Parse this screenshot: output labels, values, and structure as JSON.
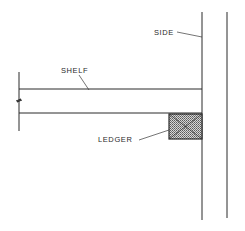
{
  "diagram": {
    "labels": {
      "side": "SIDE",
      "shelf": "SHELF",
      "ledger": "LEDGER"
    },
    "colors": {
      "line": "#2b2b2b",
      "ledger_fill": "#9a9a9a",
      "background": "#ffffff"
    },
    "parts": [
      {
        "id": "side",
        "description": "vertical side panel"
      },
      {
        "id": "shelf",
        "description": "horizontal shelf board, broken at left end"
      },
      {
        "id": "ledger",
        "description": "cross-hatched ledger block under shelf at side"
      }
    ]
  }
}
